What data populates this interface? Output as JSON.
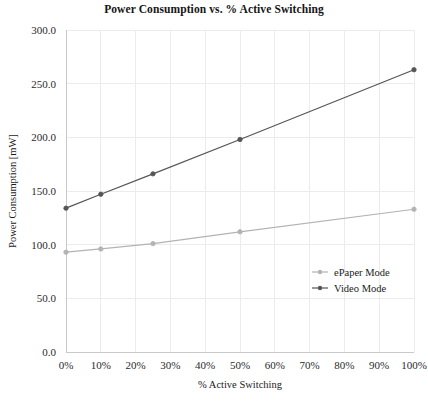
{
  "chart_data": {
    "type": "line",
    "title": "Power Consumption vs. % Active Switching",
    "xlabel": "% Active Switching",
    "ylabel": "Power Consumption [mW]",
    "x": [
      0,
      10,
      25,
      50,
      100
    ],
    "xlim": [
      0,
      100
    ],
    "ylim": [
      0,
      300
    ],
    "x_tick_values": [
      0,
      10,
      20,
      30,
      40,
      50,
      60,
      70,
      80,
      90,
      100
    ],
    "x_tick_labels": [
      "0%",
      "10%",
      "20%",
      "30%",
      "40%",
      "50%",
      "60%",
      "70%",
      "80%",
      "90%",
      "100%"
    ],
    "y_tick_values": [
      0,
      50,
      100,
      150,
      200,
      250,
      300
    ],
    "y_tick_labels": [
      "0.0",
      "50.0",
      "100.0",
      "150.0",
      "200.0",
      "250.0",
      "300.0"
    ],
    "grid": "both-light",
    "legend_position": "center-right",
    "series": [
      {
        "name": "ePaper Mode",
        "color": "#b3b3b3",
        "marker": "circle",
        "values": [
          93,
          96,
          101,
          112,
          133
        ]
      },
      {
        "name": "Video Mode",
        "color": "#555555",
        "marker": "circle",
        "values": [
          134,
          147,
          166,
          198,
          263
        ]
      }
    ]
  },
  "legend": {
    "items": [
      {
        "label": "ePaper Mode",
        "color": "#b3b3b3"
      },
      {
        "label": "Video Mode",
        "color": "#555555"
      }
    ]
  },
  "colors": {
    "background": "#ffffff",
    "grid": "#ececed",
    "axis": "#c9c9c9",
    "text": "#1a1a1a"
  }
}
